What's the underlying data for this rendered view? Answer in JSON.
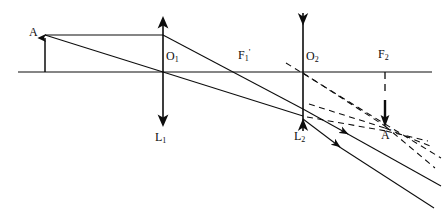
{
  "figure": {
    "type": "optics-ray-diagram",
    "background_color": "#ffffff",
    "stroke_color": "#0d0d0d"
  },
  "labels": {
    "object_point": "A",
    "lens1_center": "O",
    "lens1_center_sub": "1",
    "lens1_name": "L",
    "lens1_name_sub": "1",
    "focal1_image": "F",
    "focal1_image_sub": "1",
    "focal1_image_prime": "'",
    "lens2_center": "O",
    "lens2_center_sub": "2",
    "lens2_name": "L",
    "lens2_name_sub": "2",
    "focal2": "F",
    "focal2_sub": "2",
    "image_point": "A",
    "image_point_prime": "'"
  },
  "label_positions": {
    "object_point": {
      "x": 29,
      "y": 32
    },
    "lens1_center": {
      "x": 167,
      "y": 56
    },
    "lens1_name": {
      "x": 157,
      "y": 139
    },
    "focal1_image": {
      "x": 238,
      "y": 44
    },
    "lens2_center": {
      "x": 307,
      "y": 56
    },
    "lens2_name": {
      "x": 296,
      "y": 137
    },
    "focal2": {
      "x": 379,
      "y": 44
    },
    "image_point": {
      "x": 383,
      "y": 135
    }
  },
  "geometry": {
    "optical_axis": {
      "x1": 18,
      "y1": 72,
      "x2": 432,
      "y2": 72
    },
    "object_arrow": {
      "x": 45,
      "y_base": 72,
      "y_tip": 35
    },
    "lens1": {
      "x": 163,
      "y_top": 18,
      "y_bottom": 124,
      "kind": "converging"
    },
    "lens2": {
      "x": 303,
      "y_top": 12,
      "y_bottom": 132,
      "kind": "diverging"
    },
    "focal1_image_point": {
      "x": 248,
      "y": 72
    },
    "focal2_point": {
      "x": 385,
      "y": 72
    },
    "focal2_dash": {
      "x": 385,
      "y1": 72,
      "y2": 118
    },
    "image_arrow": {
      "x": 385,
      "y_top": 98,
      "y_tip": 125
    }
  },
  "rays": {
    "incident_parallel": {
      "x1": 45,
      "y1": 35,
      "x2": 303,
      "y2": 102,
      "note": "ray from A parallel to axis through L1 then refracted toward F1-prime and on to L2"
    },
    "incident_parallel_seg1": {
      "x1": 45,
      "y1": 35,
      "x2": 163,
      "y2": 35
    },
    "incident_parallel_seg2": {
      "x1": 163,
      "y1": 35,
      "x2": 303,
      "y2": 109
    },
    "incident_through_center": {
      "x1": 45,
      "y1": 35,
      "x2": 163,
      "y2": 72
    },
    "center_ray_after_l1": {
      "x1": 163,
      "y1": 72,
      "x2": 303,
      "y2": 116
    },
    "exit_ray_upper": {
      "x1": 303,
      "y1": 102,
      "x2": 440,
      "y2": 168
    },
    "exit_ray_lower": {
      "x1": 303,
      "y1": 116,
      "x2": 440,
      "y2": 186
    },
    "virtual_dash_upper": {
      "x1": 288,
      "y1": 64,
      "x2": 432,
      "y2": 140
    },
    "virtual_dash_lower": {
      "x1": 303,
      "y1": 72,
      "x2": 430,
      "y2": 152
    }
  },
  "legend": {
    "solid_lines": "real light rays",
    "dashed_lines": "virtual ray extensions"
  }
}
